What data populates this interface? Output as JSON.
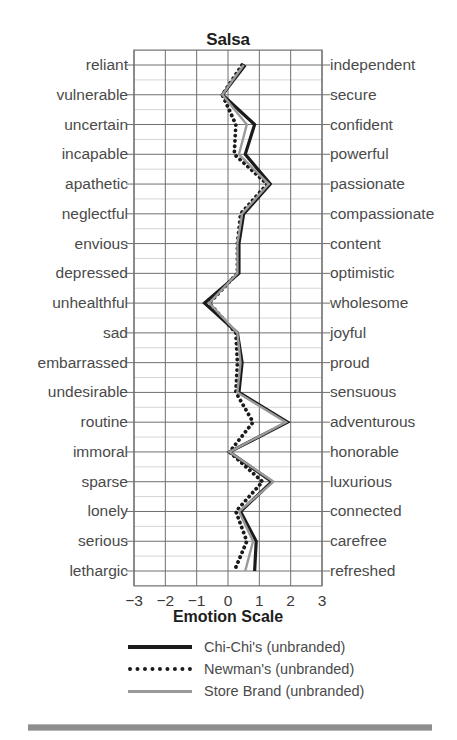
{
  "chart_data": {
    "type": "line",
    "orientation": "vertical-categories",
    "title": "Salsa",
    "xlabel": "Emotion Scale",
    "ylabel": "",
    "xlim": [
      -3,
      3
    ],
    "xticks": [
      -3,
      -2,
      -1,
      0,
      1,
      2,
      3
    ],
    "xtick_labels": [
      "−3",
      "−2",
      "−1",
      "0",
      "1",
      "2",
      "3"
    ],
    "grid": true,
    "legend_position": "bottom",
    "categories_left": [
      "reliant",
      "vulnerable",
      "uncertain",
      "incapable",
      "apathetic",
      "neglectful",
      "envious",
      "depressed",
      "unhealthful",
      "sad",
      "embarrassed",
      "undesirable",
      "routine",
      "immoral",
      "sparse",
      "lonely",
      "serious",
      "lethargic"
    ],
    "categories_right": [
      "independent",
      "secure",
      "confident",
      "powerful",
      "passionate",
      "compassionate",
      "content",
      "optimistic",
      "wholesome",
      "joyful",
      "proud",
      "sensuous",
      "adventurous",
      "honorable",
      "luxurious",
      "connected",
      "carefree",
      "refreshed"
    ],
    "series": [
      {
        "name": "Chi-Chi's (unbranded)",
        "style": "solid",
        "color": "#1b1b1b",
        "width": 3.2,
        "values": [
          0.55,
          -0.18,
          0.85,
          0.55,
          1.35,
          0.5,
          0.35,
          0.35,
          -0.75,
          0.3,
          0.45,
          0.35,
          1.9,
          0.05,
          1.4,
          0.4,
          0.9,
          0.85
        ]
      },
      {
        "name": "Newman's (unbranded)",
        "style": "dotted",
        "color": "#1b1b1b",
        "width": 3.4,
        "values": [
          0.45,
          -0.18,
          0.25,
          0.2,
          1.25,
          0.4,
          0.3,
          0.3,
          -0.6,
          0.25,
          0.3,
          0.25,
          0.8,
          0.05,
          1.1,
          0.25,
          0.6,
          0.2
        ]
      },
      {
        "name": "Store Brand (unbranded)",
        "style": "solid",
        "color": "#9a9a9a",
        "width": 2.4,
        "values": [
          0.5,
          -0.18,
          0.6,
          0.35,
          1.3,
          0.45,
          0.3,
          0.3,
          -0.6,
          0.3,
          0.4,
          0.3,
          1.85,
          0.05,
          1.45,
          0.35,
          0.8,
          0.55
        ]
      }
    ]
  },
  "legend": {
    "items": [
      {
        "label": "Chi-Chi's (unbranded)",
        "key": "solid-black"
      },
      {
        "label": "Newman's (unbranded)",
        "key": "dotted-black"
      },
      {
        "label": "Store Brand (unbranded)",
        "key": "solid-gray"
      }
    ]
  }
}
